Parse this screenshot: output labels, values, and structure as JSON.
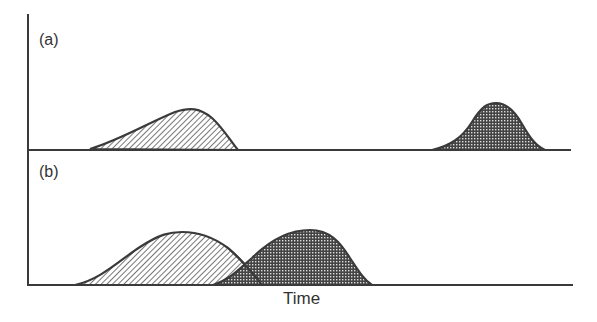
{
  "diagram": {
    "panels": [
      {
        "label": "(a)",
        "description": "Two well-separated peaks",
        "peaks": [
          {
            "pattern": "diagonal-hatch",
            "start_x": 90,
            "peak_x": 185,
            "end_x": 238,
            "relative_height": "low, asymmetric (tailing left)"
          },
          {
            "pattern": "dot-crosshatch",
            "start_x": 432,
            "peak_x": 495,
            "end_x": 545,
            "relative_height": "slightly taller"
          }
        ]
      },
      {
        "label": "(b)",
        "description": "Two overlapping peaks",
        "peaks": [
          {
            "pattern": "diagonal-hatch",
            "start_x": 75,
            "peak_x": 182,
            "end_x": 262
          },
          {
            "pattern": "dot-crosshatch",
            "start_x": 213,
            "peak_x": 310,
            "end_x": 372
          }
        ]
      }
    ],
    "xlabel": "Time",
    "colors": {
      "line": "#3a3a3a",
      "hatch": "#555555",
      "dots": "#444444",
      "background": "#ffffff"
    }
  }
}
